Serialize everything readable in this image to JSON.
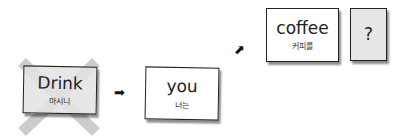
{
  "cards": [
    {
      "id": "drink",
      "word": "Drink",
      "korean": "마시니",
      "crossed_out": true,
      "fill": "#e3e3e3"
    },
    {
      "id": "you",
      "word": "you",
      "korean": "너는",
      "crossed_out": false,
      "fill": "#ffffff"
    },
    {
      "id": "coffee",
      "word": "coffee",
      "korean": "커피를",
      "crossed_out": false,
      "fill": "#ffffff"
    },
    {
      "id": "question",
      "word": "?",
      "korean": "",
      "crossed_out": false,
      "fill": "#e6e6e6"
    }
  ],
  "arrows": [
    {
      "id": "arrow-1",
      "glyph": "➡"
    },
    {
      "id": "arrow-2",
      "glyph": "⬈"
    }
  ],
  "colors": {
    "cross": "#cccccc",
    "card_border": "#222222"
  }
}
